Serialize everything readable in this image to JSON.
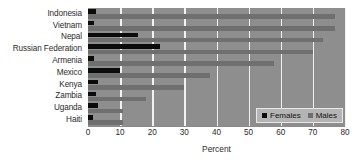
{
  "chart_data": {
    "type": "bar",
    "orientation": "horizontal",
    "title": "",
    "xlabel": "Percent",
    "ylabel": "",
    "xlim": [
      0,
      80
    ],
    "xticks": [
      0,
      10,
      20,
      30,
      40,
      50,
      60,
      70,
      80
    ],
    "grid": true,
    "legend_position": "bottom-right",
    "categories": [
      "Indonesia",
      "Vietnam",
      "Nepal",
      "Russian Federation",
      "Armenia",
      "Mexico",
      "Kenya",
      "Zambia",
      "Uganda",
      "Haiti"
    ],
    "series": [
      {
        "name": "Females",
        "color": "#0b0b0b",
        "values": [
          2.5,
          2.0,
          15.5,
          22.5,
          2.0,
          10.0,
          3.0,
          2.5,
          3.0,
          1.5
        ]
      },
      {
        "name": "Males",
        "color": "#6f6f6f",
        "values": [
          77.0,
          77.0,
          73.0,
          70.0,
          58.0,
          38.0,
          30.0,
          18.0,
          11.0,
          11.0
        ]
      }
    ]
  },
  "legend": {
    "entries": [
      {
        "label": "Females",
        "color": "#0b0b0b"
      },
      {
        "label": "Males",
        "color": "#6f6f6f"
      }
    ]
  },
  "axis": {
    "x_title": "Percent"
  },
  "colors": {
    "plot_background": "#8e8e8e",
    "gridline": "#f2f2f2",
    "females": "#0b0b0b",
    "males": "#6f6f6f",
    "text": "#2b2b2b",
    "legend_background": "#b4b4b4"
  }
}
